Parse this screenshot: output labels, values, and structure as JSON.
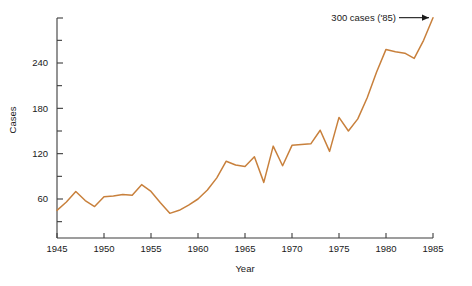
{
  "chart_data": {
    "type": "line",
    "title": "",
    "xlabel": "Year",
    "ylabel": "Cases",
    "xlim": [
      1945,
      1985
    ],
    "ylim": [
      0,
      300
    ],
    "grid": false,
    "legend": "none",
    "line_color": "#C8803C",
    "axis_color": "#3C3C3C",
    "text_color": "#1A1A1A",
    "x_ticks": [
      1945,
      1950,
      1955,
      1960,
      1965,
      1970,
      1975,
      1980,
      1985
    ],
    "x_tick_labels": [
      "1945",
      "1950",
      "1955",
      "1960",
      "1965",
      "1970",
      "1975",
      "1980",
      "1985"
    ],
    "y_ticks": [
      60,
      120,
      180,
      240
    ],
    "y_tick_labels": [
      "60",
      "120",
      "180",
      "240"
    ],
    "y_minor_ticks": [
      30,
      90,
      150,
      210,
      270
    ],
    "x": [
      1945,
      1946,
      1947,
      1948,
      1949,
      1950,
      1951,
      1952,
      1953,
      1954,
      1955,
      1956,
      1957,
      1958,
      1959,
      1960,
      1961,
      1962,
      1963,
      1964,
      1965,
      1966,
      1967,
      1968,
      1969,
      1970,
      1971,
      1972,
      1973,
      1974,
      1975,
      1976,
      1977,
      1978,
      1979,
      1980,
      1981,
      1982,
      1983,
      1984,
      1985
    ],
    "values": [
      45,
      56,
      70,
      58,
      50,
      63,
      64,
      66,
      65,
      79,
      70,
      55,
      41,
      45,
      52,
      60,
      72,
      88,
      110,
      105,
      103,
      116,
      82,
      130,
      104,
      131,
      132,
      133,
      151,
      123,
      168,
      150,
      166,
      194,
      228,
      258,
      255,
      253,
      246,
      270,
      300
    ],
    "annotations": [
      {
        "text": "300 cases ('85)",
        "x": 1985,
        "y": 300,
        "arrow": "right"
      }
    ]
  }
}
